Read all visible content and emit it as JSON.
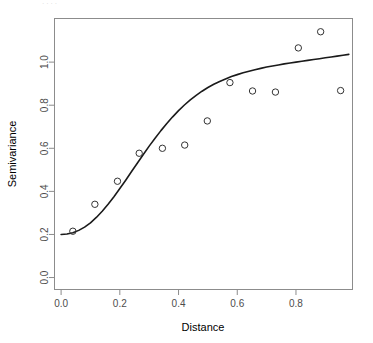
{
  "figure": {
    "background_color": "#ffffff",
    "foreground_color": "#000000",
    "axis_color": "#808080",
    "tick_label_color": "#4d4d4d",
    "point_color": "#333333",
    "curve_color": "#1a1a1a",
    "top_fragment_text": "· · · ·"
  },
  "chart_data": {
    "type": "scatter",
    "title": "",
    "subtitle": "",
    "xlabel": "Distance",
    "ylabel": "Semivariance",
    "xlim": [
      -0.0225,
      0.9925
    ],
    "ylim": [
      -0.0555,
      1.2025
    ],
    "xticks": [
      0.0,
      0.2,
      0.4,
      0.6,
      0.8
    ],
    "xtick_labels": [
      "0.0",
      "0.2",
      "0.4",
      "0.6",
      "0.8"
    ],
    "yticks": [
      0.0,
      0.2,
      0.4,
      0.6,
      0.8,
      1.0
    ],
    "ytick_labels": [
      "0.0",
      "0.2",
      "0.4",
      "0.6",
      "0.8",
      "1.0"
    ],
    "grid": false,
    "legend": null,
    "legend_position": "none",
    "box": true,
    "series": [
      {
        "name": "Empirical semivariogram",
        "type": "scatter",
        "marker": "open-circle",
        "marker_size": 3.2,
        "x": [
          0.04,
          0.115,
          0.192,
          0.266,
          0.345,
          0.421,
          0.498,
          0.575,
          0.652,
          0.73,
          0.808,
          0.884,
          0.952
        ],
        "y": [
          0.215,
          0.34,
          0.447,
          0.577,
          0.6,
          0.615,
          0.727,
          0.905,
          0.866,
          0.861,
          1.066,
          1.141,
          0.868
        ]
      },
      {
        "name": "Fitted variogram model",
        "type": "line",
        "line_width": 1.6,
        "x": [
          0.0,
          0.02,
          0.04,
          0.06,
          0.08,
          0.1,
          0.12,
          0.14,
          0.16,
          0.18,
          0.2,
          0.22,
          0.24,
          0.26,
          0.28,
          0.3,
          0.32,
          0.34,
          0.36,
          0.38,
          0.4,
          0.42,
          0.44,
          0.46,
          0.48,
          0.5,
          0.52,
          0.54,
          0.56,
          0.58,
          0.6,
          0.62,
          0.64,
          0.66,
          0.68,
          0.7,
          0.72,
          0.74,
          0.76,
          0.78,
          0.8,
          0.82,
          0.84,
          0.86,
          0.88,
          0.9,
          0.92,
          0.94,
          0.96,
          0.98
        ],
        "y": [
          0.2,
          0.202,
          0.208,
          0.219,
          0.234,
          0.254,
          0.279,
          0.308,
          0.34,
          0.375,
          0.413,
          0.452,
          0.492,
          0.532,
          0.571,
          0.61,
          0.647,
          0.682,
          0.715,
          0.746,
          0.775,
          0.801,
          0.825,
          0.846,
          0.865,
          0.882,
          0.897,
          0.91,
          0.922,
          0.933,
          0.942,
          0.951,
          0.958,
          0.965,
          0.971,
          0.977,
          0.982,
          0.987,
          0.992,
          0.996,
          1.0,
          1.004,
          1.008,
          1.012,
          1.016,
          1.02,
          1.024,
          1.028,
          1.032,
          1.036
        ]
      }
    ],
    "model": {
      "nugget": 0.2,
      "sill": 1.06,
      "range": 0.6,
      "shape": "sigmoid"
    }
  }
}
